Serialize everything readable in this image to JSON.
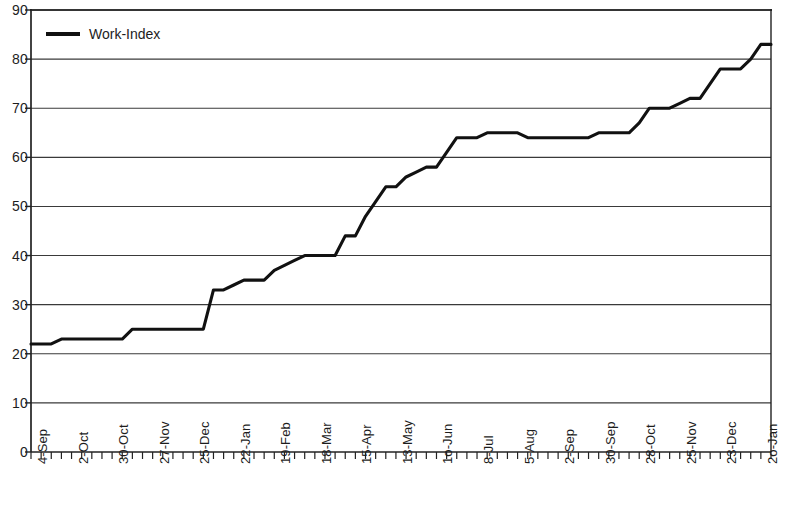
{
  "chart_data": {
    "type": "line",
    "title": "",
    "xlabel": "",
    "ylabel": "",
    "ylim": [
      0,
      90
    ],
    "ytick_step": 10,
    "yticks": [
      0,
      10,
      20,
      30,
      40,
      50,
      60,
      70,
      80,
      90
    ],
    "grid": true,
    "grid_axis": "y",
    "legend": {
      "position": "top-left-inside",
      "entries": [
        {
          "name": "Work-Index",
          "color": "#111111",
          "marker": "line"
        }
      ]
    },
    "series": [
      {
        "name": "Work-Index",
        "color": "#111111",
        "values": [
          22,
          22,
          22,
          23,
          23,
          23,
          23,
          23,
          23,
          23,
          25,
          25,
          25,
          25,
          25,
          25,
          25,
          25,
          33,
          33,
          34,
          35,
          35,
          35,
          37,
          38,
          39,
          40,
          40,
          40,
          40,
          44,
          44,
          48,
          51,
          54,
          54,
          56,
          57,
          58,
          58,
          61,
          64,
          64,
          64,
          65,
          65,
          65,
          65,
          64,
          64,
          64,
          64,
          64,
          64,
          64,
          65,
          65,
          65,
          65,
          67,
          70,
          70,
          70,
          71,
          72,
          72,
          75,
          78,
          78,
          78,
          80,
          83,
          83
        ]
      }
    ],
    "x_tick_count": 74,
    "x_label_interval": 4,
    "xticklabels": [
      "4-Sep",
      "2-Oct",
      "30-Oct",
      "27-Nov",
      "25-Dec",
      "22-Jan",
      "19-Feb",
      "18-Mar",
      "15-Apr",
      "13-May",
      "1o-Jun",
      "8-Jul",
      "5-Aug",
      "2-Sep",
      "30-Sep",
      "28-Oct",
      "25-Nov",
      "23-Dec",
      "2o-Jan",
      "17-Feb",
      "17-Mar",
      "14-Apr"
    ]
  }
}
